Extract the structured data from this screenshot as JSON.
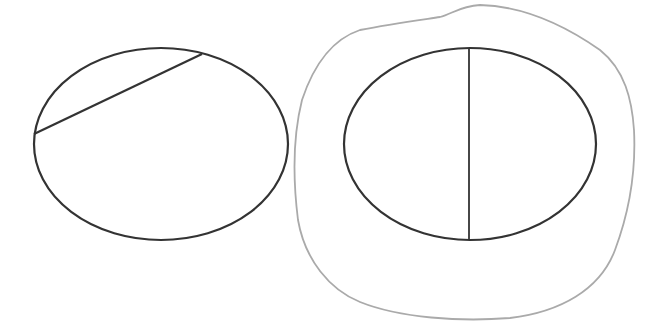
{
  "diagram": {
    "colors": {
      "stroke": "#333333",
      "highlight": "#aaaaaa",
      "background": "#ffffff"
    },
    "left_ellipse": {
      "cx": 161,
      "cy": 144,
      "rx": 127,
      "ry": 96,
      "chord": {
        "x1": 34,
        "y1": 134,
        "x2": 202,
        "y2": 54
      }
    },
    "right_ellipse": {
      "cx": 470,
      "cy": 144,
      "rx": 126,
      "ry": 96,
      "diameter": {
        "x1": 469,
        "y1": 48,
        "x2": 469,
        "y2": 240
      }
    }
  }
}
